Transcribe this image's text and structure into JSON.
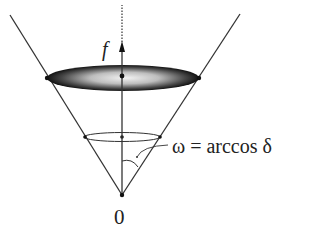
{
  "diagram": {
    "type": "cone-diagram",
    "labels": {
      "vector": "f",
      "angle": "ω = arccos δ",
      "origin": "0"
    },
    "colors": {
      "stroke": "#333333",
      "disk_dark": "#1a1a1a",
      "disk_light": "#e8e8e8",
      "background": "#ffffff"
    },
    "elements": [
      "cone-boundary-lines",
      "shaded-disk-cross-section",
      "small-cross-section-ellipse",
      "vertical-axis",
      "dotted-axis-extension",
      "vector-arrow-f",
      "angle-arc",
      "origin-point"
    ]
  }
}
